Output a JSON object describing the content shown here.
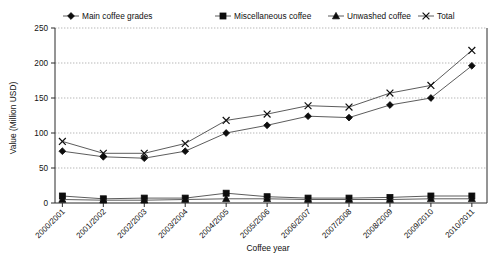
{
  "chart_data": {
    "type": "line",
    "title": "",
    "xlabel": "Coffee year",
    "ylabel": "Value (Million USD)",
    "categories": [
      "2000/2001",
      "2001/2002",
      "2002/2003",
      "2003/2004",
      "2004/2005",
      "2005/2006",
      "2006/2007",
      "2007/2008",
      "2008/2009",
      "2009/2010",
      "2010/2011"
    ],
    "series": [
      {
        "name": "Main coffee grades",
        "marker": "diamond",
        "values": [
          74,
          66,
          64,
          74,
          100,
          111,
          124,
          122,
          140,
          150,
          196
        ]
      },
      {
        "name": "Miscellaneous coffee",
        "marker": "square",
        "values": [
          10,
          6,
          7,
          7,
          14,
          9,
          7,
          7,
          8,
          10,
          10
        ]
      },
      {
        "name": "Unwashed coffee",
        "marker": "triangle",
        "values": [
          5,
          4,
          4,
          5,
          6,
          6,
          5,
          5,
          5,
          6,
          6
        ]
      },
      {
        "name": "Total",
        "marker": "cross",
        "values": [
          88,
          71,
          71,
          85,
          118,
          127,
          139,
          137,
          157,
          168,
          218
        ]
      }
    ],
    "ylim": [
      0,
      250
    ],
    "yticks": [
      0,
      50,
      100,
      150,
      200,
      250
    ],
    "grid": true,
    "legend_position": "top"
  },
  "figure": {
    "caption_ghost": ""
  }
}
